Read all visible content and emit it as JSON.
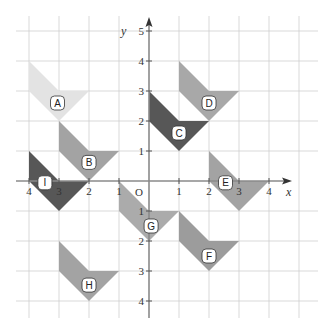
{
  "figure": {
    "axes": {
      "x_label": "x",
      "y_label": "y",
      "origin_label": "O",
      "x_ticks": [
        -4,
        -3,
        -2,
        -1,
        1,
        2,
        3,
        4
      ],
      "y_ticks": [
        -4,
        -3,
        -2,
        -1,
        1,
        2,
        3,
        4,
        5
      ],
      "x_range": [
        -4.5,
        5
      ],
      "y_range": [
        -4.5,
        5.5
      ]
    },
    "grid": {
      "on": true,
      "spacing": 1
    },
    "shapes": [
      {
        "label": "A",
        "color": "#e3e3e3",
        "vertices": [
          [
            -4,
            4
          ],
          [
            -3,
            3
          ],
          [
            -2,
            3
          ],
          [
            -3,
            2
          ],
          [
            -4,
            3
          ]
        ],
        "label_pos": [
          -3.05,
          2.6
        ]
      },
      {
        "label": "B",
        "color": "#a3a3a3",
        "vertices": [
          [
            -3,
            2
          ],
          [
            -2,
            1
          ],
          [
            -1,
            1
          ],
          [
            -2,
            0
          ],
          [
            -3,
            1
          ]
        ],
        "label_pos": [
          -2.0,
          0.62
        ]
      },
      {
        "label": "C",
        "color": "#575757",
        "vertices": [
          [
            0,
            3
          ],
          [
            1,
            2
          ],
          [
            2,
            2
          ],
          [
            1,
            1
          ],
          [
            0,
            2
          ]
        ],
        "label_pos": [
          1.0,
          1.6
        ]
      },
      {
        "label": "D",
        "color": "#a8a8a8",
        "vertices": [
          [
            1,
            4
          ],
          [
            2,
            3
          ],
          [
            3,
            3
          ],
          [
            2,
            2
          ],
          [
            1,
            3
          ]
        ],
        "label_pos": [
          2.0,
          2.6
        ]
      },
      {
        "label": "E",
        "color": "#a3a3a3",
        "vertices": [
          [
            2,
            1
          ],
          [
            3,
            0
          ],
          [
            4,
            0
          ],
          [
            3,
            -1
          ],
          [
            2,
            0
          ]
        ],
        "label_pos": [
          2.55,
          -0.06
        ]
      },
      {
        "label": "F",
        "color": "#9c9c9c",
        "vertices": [
          [
            1,
            -1
          ],
          [
            2,
            -2
          ],
          [
            3,
            -2
          ],
          [
            2,
            -3
          ],
          [
            1,
            -2
          ]
        ],
        "label_pos": [
          2.0,
          -2.5
        ]
      },
      {
        "label": "G",
        "color": "#ababab",
        "vertices": [
          [
            -1,
            0
          ],
          [
            0,
            -1
          ],
          [
            1,
            -1
          ],
          [
            0,
            -2
          ],
          [
            -1,
            -1
          ]
        ],
        "label_pos": [
          0.07,
          -1.5
        ]
      },
      {
        "label": "H",
        "color": "#a3a3a3",
        "vertices": [
          [
            -3,
            -2
          ],
          [
            -2,
            -3
          ],
          [
            -1,
            -3
          ],
          [
            -2,
            -4
          ],
          [
            -3,
            -3
          ]
        ],
        "label_pos": [
          -2.0,
          -3.47
        ]
      },
      {
        "label": "I",
        "color": "#575757",
        "vertices": [
          [
            -4,
            1
          ],
          [
            -3,
            0
          ],
          [
            -2,
            0
          ],
          [
            -3,
            -1
          ],
          [
            -4,
            0
          ]
        ],
        "label_pos": [
          -3.47,
          -0.06
        ]
      }
    ]
  }
}
